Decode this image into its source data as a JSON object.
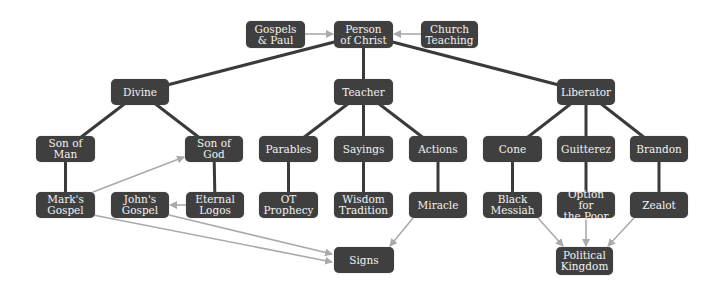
{
  "diagram": {
    "colors": {
      "node_fill": "#3f3f3f",
      "node_text": "#f2f2f2",
      "tree_edge": "#3a3a3a",
      "arrow_edge": "#aaaaaa",
      "background": "#ffffff"
    },
    "nodes": {
      "gospels_paul": {
        "label": "Gospels\n& Paul",
        "x": 246,
        "y": 21,
        "w": 59,
        "h": 27
      },
      "person_christ": {
        "label": "Person\nof Christ",
        "x": 334,
        "y": 21,
        "w": 59,
        "h": 27
      },
      "church_teaching": {
        "label": "Church\nTeaching",
        "x": 421,
        "y": 21,
        "w": 57,
        "h": 27
      },
      "divine": {
        "label": "Divine",
        "x": 111,
        "y": 79,
        "w": 58,
        "h": 26
      },
      "teacher": {
        "label": "Teacher",
        "x": 334,
        "y": 79,
        "w": 59,
        "h": 26
      },
      "liberator": {
        "label": "Liberator",
        "x": 557,
        "y": 79,
        "w": 58,
        "h": 26
      },
      "son_of_man": {
        "label": "Son of Man",
        "x": 36,
        "y": 136,
        "w": 59,
        "h": 26
      },
      "son_of_god": {
        "label": "Son of God",
        "x": 185,
        "y": 136,
        "w": 58,
        "h": 26
      },
      "parables": {
        "label": "Parables",
        "x": 259,
        "y": 136,
        "w": 59,
        "h": 26
      },
      "sayings": {
        "label": "Sayings",
        "x": 334,
        "y": 136,
        "w": 59,
        "h": 26
      },
      "actions": {
        "label": "Actions",
        "x": 409,
        "y": 136,
        "w": 58,
        "h": 26
      },
      "cone": {
        "label": "Cone",
        "x": 483,
        "y": 136,
        "w": 59,
        "h": 26
      },
      "guitterez": {
        "label": "Guitterez",
        "x": 557,
        "y": 136,
        "w": 58,
        "h": 26
      },
      "brandon": {
        "label": "Brandon",
        "x": 630,
        "y": 136,
        "w": 58,
        "h": 26
      },
      "marks_gospel": {
        "label": "Mark's\nGospel",
        "x": 36,
        "y": 192,
        "w": 59,
        "h": 26
      },
      "johns_gospel": {
        "label": "John's\nGospel",
        "x": 111,
        "y": 192,
        "w": 58,
        "h": 26
      },
      "eternal_logos": {
        "label": "Eternal\nLogos",
        "x": 186,
        "y": 192,
        "w": 58,
        "h": 26
      },
      "ot_prophecy": {
        "label": "OT\nProphecy",
        "x": 259,
        "y": 192,
        "w": 59,
        "h": 26
      },
      "wisdom_tradition": {
        "label": "Wisdom\nTradition",
        "x": 334,
        "y": 192,
        "w": 59,
        "h": 26
      },
      "miracle": {
        "label": "Miracle",
        "x": 409,
        "y": 192,
        "w": 58,
        "h": 26
      },
      "black_messiah": {
        "label": "Black\nMessiah",
        "x": 483,
        "y": 192,
        "w": 59,
        "h": 26
      },
      "option_poor": {
        "label": "Option for\nthe Poor",
        "x": 557,
        "y": 192,
        "w": 58,
        "h": 26
      },
      "zealot": {
        "label": "Zealot",
        "x": 630,
        "y": 192,
        "w": 58,
        "h": 26
      },
      "signs": {
        "label": "Signs",
        "x": 334,
        "y": 247,
        "w": 60,
        "h": 26
      },
      "political_kingdom": {
        "label": "Political\nKingdom",
        "x": 556,
        "y": 247,
        "w": 57,
        "h": 28
      }
    },
    "tree_edges": [
      [
        "person_christ",
        "divine"
      ],
      [
        "person_christ",
        "teacher"
      ],
      [
        "person_christ",
        "liberator"
      ],
      [
        "divine",
        "son_of_man"
      ],
      [
        "divine",
        "son_of_god"
      ],
      [
        "teacher",
        "parables"
      ],
      [
        "teacher",
        "sayings"
      ],
      [
        "teacher",
        "actions"
      ],
      [
        "liberator",
        "cone"
      ],
      [
        "liberator",
        "guitterez"
      ],
      [
        "liberator",
        "brandon"
      ],
      [
        "son_of_man",
        "marks_gospel"
      ],
      [
        "son_of_god",
        "eternal_logos"
      ],
      [
        "parables",
        "ot_prophecy"
      ],
      [
        "sayings",
        "wisdom_tradition"
      ],
      [
        "actions",
        "miracle"
      ],
      [
        "cone",
        "black_messiah"
      ],
      [
        "guitterez",
        "option_poor"
      ],
      [
        "brandon",
        "zealot"
      ]
    ],
    "arrow_edges": [
      {
        "from": [
          305,
          34
        ],
        "to": [
          333,
          34
        ]
      },
      {
        "from": [
          421,
          34
        ],
        "to": [
          394,
          34
        ]
      },
      {
        "from": [
          93,
          192
        ],
        "to": [
          184,
          157
        ]
      },
      {
        "from": [
          186,
          205
        ],
        "to": [
          170,
          205
        ]
      },
      {
        "from": [
          93,
          215
        ],
        "to": [
          332,
          262
        ]
      },
      {
        "from": [
          169,
          215
        ],
        "to": [
          332,
          254
        ]
      },
      {
        "from": [
          413,
          218
        ],
        "to": [
          390,
          246
        ]
      },
      {
        "from": [
          538,
          218
        ],
        "to": [
          563,
          246
        ]
      },
      {
        "from": [
          586,
          218
        ],
        "to": [
          586,
          246
        ]
      },
      {
        "from": [
          634,
          218
        ],
        "to": [
          608,
          246
        ]
      }
    ]
  }
}
